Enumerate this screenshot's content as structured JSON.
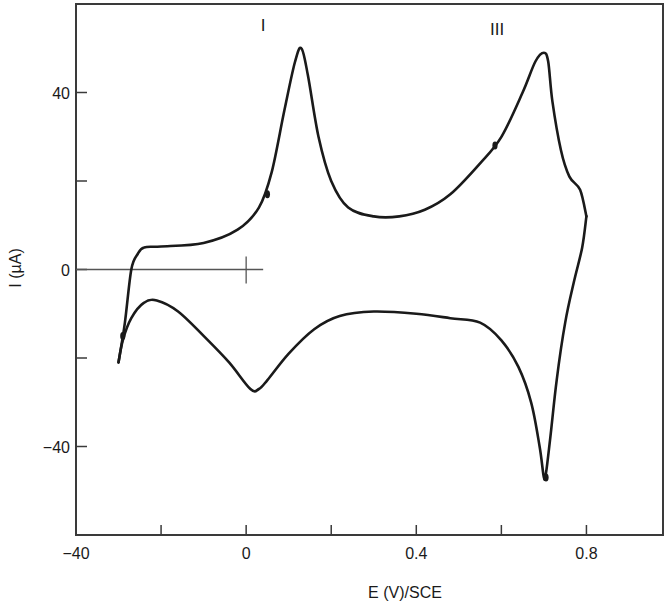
{
  "chart_data": {
    "type": "line",
    "title": "",
    "xlabel": "E (V)/SCE",
    "ylabel": "I (µA)",
    "xlim": [
      -0.4,
      0.98
    ],
    "ylim": [
      -60,
      60
    ],
    "grid": false,
    "legend": null,
    "x_ticks": [
      {
        "value": -0.4,
        "label": "−40"
      },
      {
        "value": -0.2,
        "label": ""
      },
      {
        "value": 0.0,
        "label": "0"
      },
      {
        "value": 0.2,
        "label": ""
      },
      {
        "value": 0.4,
        "label": "0.4"
      },
      {
        "value": 0.6,
        "label": ""
      },
      {
        "value": 0.8,
        "label": "0.8"
      }
    ],
    "y_ticks": [
      {
        "value": 40,
        "label": "40"
      },
      {
        "value": 20,
        "label": ""
      },
      {
        "value": 0,
        "label": "0"
      },
      {
        "value": -20,
        "label": ""
      },
      {
        "value": -40,
        "label": "−40"
      }
    ],
    "annotations": [
      {
        "text": "I",
        "x": 0.04,
        "y": 54
      },
      {
        "text": "III",
        "x": 0.59,
        "y": 53
      }
    ],
    "series": [
      {
        "name": "anodic sweep",
        "x": [
          -0.3,
          -0.285,
          -0.27,
          -0.255,
          -0.24,
          -0.2,
          -0.1,
          -0.02,
          0.03,
          0.06,
          0.09,
          0.115,
          0.13,
          0.145,
          0.17,
          0.2,
          0.24,
          0.3,
          0.36,
          0.42,
          0.48,
          0.55,
          0.6,
          0.65,
          0.68,
          0.7,
          0.71,
          0.72,
          0.74,
          0.76,
          0.785,
          0.8
        ],
        "y": [
          -21,
          -12,
          0,
          3.5,
          5,
          5.2,
          6,
          9,
          14,
          22,
          36,
          47,
          50,
          44,
          30,
          20,
          14,
          12,
          12,
          13.5,
          17,
          24,
          30,
          40,
          47,
          49,
          47,
          38,
          27,
          21,
          18,
          12
        ]
      },
      {
        "name": "cathodic sweep",
        "x": [
          0.8,
          0.79,
          0.77,
          0.75,
          0.73,
          0.715,
          0.705,
          0.7,
          0.69,
          0.67,
          0.64,
          0.6,
          0.55,
          0.48,
          0.4,
          0.3,
          0.22,
          0.16,
          0.1,
          0.05,
          0.03,
          0.01,
          -0.04,
          -0.1,
          -0.16,
          -0.21,
          -0.24,
          -0.27,
          -0.29,
          -0.3
        ],
        "y": [
          12,
          5,
          -3,
          -12,
          -25,
          -38,
          -46,
          -47,
          -40,
          -30,
          -22,
          -16,
          -12,
          -11,
          -10,
          -9.5,
          -10.5,
          -13.5,
          -19,
          -25,
          -27,
          -27,
          -21,
          -15,
          -9.5,
          -7,
          -7.5,
          -11,
          -16,
          -21
        ]
      }
    ],
    "reference_line": {
      "y": 0,
      "x_from": -0.4,
      "x_to": 0.04,
      "marker_x": 0.0
    }
  }
}
